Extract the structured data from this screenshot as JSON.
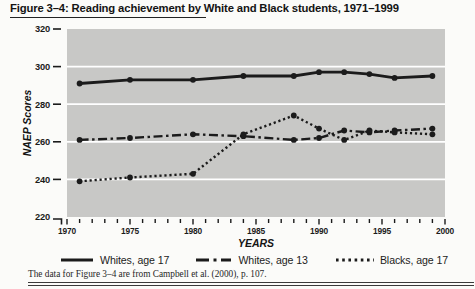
{
  "page": {
    "title": "Figure 3–4: Reading achievement by White and Black students, 1971–1999",
    "source_note": "The data for Figure 3–4 are from Campbell et al. (2000), p. 107."
  },
  "colors": {
    "page_background": "#fbfbf9",
    "plot_background": "#c8c8c6",
    "gridline": "#ffffff",
    "ink": "#1b1b1b"
  },
  "chart_data": {
    "type": "line",
    "title": "Figure 3–4: Reading achievement by White and Black students, 1971–1999",
    "xlabel": "YEARS",
    "ylabel": "NAEP Scores",
    "xlim": [
      1970,
      2000
    ],
    "ylim": [
      220,
      320
    ],
    "xticks": [
      1970,
      1975,
      1980,
      1985,
      1990,
      1995,
      2000
    ],
    "xtick_minor_step": 1,
    "yticks": [
      220,
      240,
      260,
      280,
      300,
      320
    ],
    "grid": "horizontal white gridlines on gray plot area",
    "legend_position": "bottom",
    "x": [
      1971,
      1975,
      1980,
      1984,
      1988,
      1990,
      1992,
      1994,
      1996,
      1999
    ],
    "series": [
      {
        "name": "Whites, age 17",
        "line_style": "solid",
        "values": [
          291,
          293,
          293,
          295,
          295,
          297,
          297,
          296,
          294,
          295
        ]
      },
      {
        "name": "Whites, age 13",
        "line_style": "dash-dot",
        "values": [
          261,
          262,
          264,
          263,
          261,
          262,
          266,
          265,
          266,
          267
        ]
      },
      {
        "name": "Blacks, age 17",
        "line_style": "dotted",
        "values": [
          239,
          241,
          243,
          264,
          274,
          267,
          261,
          266,
          265,
          264
        ]
      }
    ]
  }
}
